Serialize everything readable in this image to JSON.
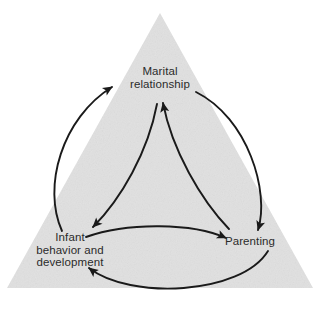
{
  "figure": {
    "type": "triangle-cycle-diagram",
    "background_color": "#ffffff",
    "triangle_fill": "#e2e2e2",
    "line_color": "#1a1a1a",
    "text_color": "#2b2b2b"
  },
  "nodes": [
    {
      "id": "marital",
      "name": "marital-relationship",
      "lines": [
        "Marital",
        "relationship"
      ],
      "position": "apex-top",
      "x": 160,
      "y": 82
    },
    {
      "id": "infant",
      "name": "infant-behavior-and-development",
      "lines": [
        "Infant",
        "behavior and",
        "development"
      ],
      "position": "bottom-left",
      "x": 70,
      "y": 250
    },
    {
      "id": "parenting",
      "name": "parenting",
      "lines": [
        "Parenting"
      ],
      "position": "bottom-right",
      "x": 250,
      "y": 242
    }
  ],
  "arrows": [
    {
      "name": "inner-arrow-marital-to-infant",
      "from": "marital",
      "to": "infant",
      "style": "inner-curve",
      "arrowhead": "to"
    },
    {
      "name": "inner-arrow-infant-to-parenting",
      "from": "infant",
      "to": "parenting",
      "style": "inner-curve",
      "arrowhead": "to"
    },
    {
      "name": "inner-arrow-parenting-to-marital",
      "from": "parenting",
      "to": "marital",
      "style": "inner-curve",
      "arrowhead": "to"
    },
    {
      "name": "outer-arrow-infant-to-marital",
      "from": "infant",
      "to": "marital",
      "style": "outer-curve",
      "arrowhead": "to"
    },
    {
      "name": "outer-arrow-marital-to-parenting",
      "from": "marital",
      "to": "parenting",
      "style": "outer-curve",
      "arrowhead": "to"
    },
    {
      "name": "outer-arrow-parenting-to-infant",
      "from": "parenting",
      "to": "infant",
      "style": "outer-curve",
      "arrowhead": "to"
    }
  ],
  "triangle": {
    "name": "background-triangle",
    "apex": [
      160,
      13
    ],
    "bottom_left": [
      7,
      288
    ],
    "bottom_right": [
      313,
      288
    ]
  }
}
